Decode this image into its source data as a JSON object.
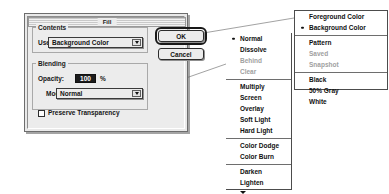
{
  "dialog": {
    "title": "Fill",
    "contents": {
      "group_label": "Contents",
      "use_label": "Use:",
      "use_value": "Background Color"
    },
    "blending": {
      "group_label": "Blending",
      "opacity_label": "Opacity:",
      "opacity_value": "100",
      "percent_sign": "%",
      "mode_label": "Mode:",
      "mode_value": "Normal",
      "preserve_transparency_label": "Preserve Transparency",
      "preserve_transparency_checked": false
    },
    "buttons": {
      "ok": "OK",
      "cancel": "Cancel"
    }
  },
  "contents_menu": {
    "groups": [
      {
        "items": [
          {
            "label": "Foreground Color",
            "selected": false,
            "disabled": false
          },
          {
            "label": "Background Color",
            "selected": true,
            "disabled": false
          }
        ]
      },
      {
        "items": [
          {
            "label": "Pattern",
            "selected": false,
            "disabled": false
          },
          {
            "label": "Saved",
            "selected": false,
            "disabled": true
          },
          {
            "label": "Snapshot",
            "selected": false,
            "disabled": true
          }
        ]
      },
      {
        "items": [
          {
            "label": "Black",
            "selected": false,
            "disabled": false
          },
          {
            "label": "50% Gray",
            "selected": false,
            "disabled": false
          },
          {
            "label": "White",
            "selected": false,
            "disabled": false
          }
        ]
      }
    ]
  },
  "mode_menu": {
    "groups": [
      {
        "items": [
          {
            "label": "Normal",
            "selected": true,
            "disabled": false
          },
          {
            "label": "Dissolve",
            "selected": false,
            "disabled": false
          },
          {
            "label": "Behind",
            "selected": false,
            "disabled": true
          },
          {
            "label": "Clear",
            "selected": false,
            "disabled": true
          }
        ]
      },
      {
        "items": [
          {
            "label": "Multiply",
            "selected": false,
            "disabled": false
          },
          {
            "label": "Screen",
            "selected": false,
            "disabled": false
          },
          {
            "label": "Overlay",
            "selected": false,
            "disabled": false
          },
          {
            "label": "Soft Light",
            "selected": false,
            "disabled": false
          },
          {
            "label": "Hard Light",
            "selected": false,
            "disabled": false
          }
        ]
      },
      {
        "items": [
          {
            "label": "Color Dodge",
            "selected": false,
            "disabled": false
          },
          {
            "label": "Color Burn",
            "selected": false,
            "disabled": false
          }
        ]
      },
      {
        "items": [
          {
            "label": "Darken",
            "selected": false,
            "disabled": false
          },
          {
            "label": "Lighten",
            "selected": false,
            "disabled": false
          }
        ],
        "scroll_more": true
      }
    ]
  },
  "colors": {
    "dialog_face": "#ececec",
    "menu_face": "#ffffff",
    "text": "#101010",
    "disabled_text": "#9f9f9f",
    "field_fill": "#1c1c1c",
    "field_text": "#ffffff",
    "border": "#4c4c4c",
    "line": "#6e6e6e"
  }
}
